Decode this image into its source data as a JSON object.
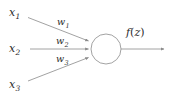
{
  "diagram": {
    "type": "artificial-neuron",
    "background_color": "#ffffff",
    "stroke_color": "#8a8a8a",
    "text_color": "#2b2b2b",
    "inputs": [
      {
        "id": "x1",
        "symbol": "x",
        "subscript": "1",
        "label": "x₁",
        "weight_symbol": "w",
        "weight_subscript": "1",
        "weight_label": "w₁"
      },
      {
        "id": "x2",
        "symbol": "x",
        "subscript": "2",
        "label": "x₂",
        "weight_symbol": "w",
        "weight_subscript": "2",
        "weight_label": "w₂"
      },
      {
        "id": "x3",
        "symbol": "x",
        "subscript": "3",
        "label": "x₃",
        "weight_symbol": "w",
        "weight_subscript": "3",
        "weight_label": "w₃"
      }
    ],
    "node": {
      "shape": "circle",
      "center_x": 106,
      "center_y": 49,
      "radius": 15
    },
    "output": {
      "label": "f(z)",
      "function_symbol": "f",
      "argument": "z"
    }
  }
}
